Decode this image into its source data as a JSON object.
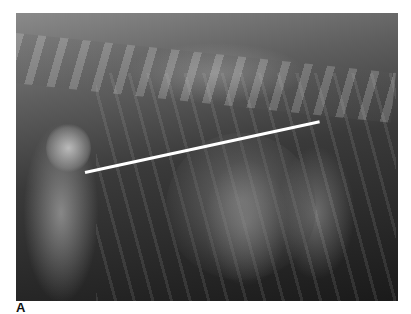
{
  "figure": {
    "panel_label": "A",
    "measurement_line": {
      "color": "#ffffff",
      "start": [
        85,
        171
      ],
      "end": [
        319,
        120
      ]
    }
  }
}
